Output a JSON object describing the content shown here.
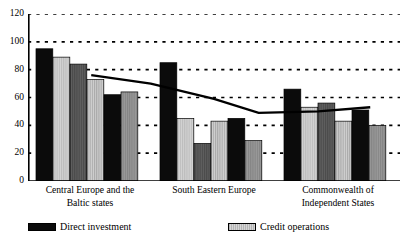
{
  "title": {
    "text": "",
    "cut_off": true
  },
  "legend": {
    "position": "bottom",
    "entries": [
      {
        "label": "Direct investment",
        "swatch": "solid-black"
      },
      {
        "label": "Credit operations",
        "swatch": "light-gray"
      }
    ]
  },
  "axis": {
    "y_ticks": [
      "0",
      "20",
      "40",
      "60",
      "80",
      "100",
      "120"
    ]
  },
  "categories": [
    {
      "line1": "Central Europe and the",
      "line2": "Baltic states"
    },
    {
      "line1": "South Eastern Europe",
      "line2": ""
    },
    {
      "line1": "Commonwealth of",
      "line2": "Independent States"
    }
  ],
  "chart_data": {
    "type": "bar",
    "title": "",
    "xlabel": "",
    "ylabel": "",
    "ylim": [
      0,
      120
    ],
    "yticks": [
      0,
      20,
      40,
      60,
      80,
      100,
      120
    ],
    "grid": true,
    "gridstyle": "dotted-horizontal",
    "legend_position": "bottom",
    "categories": [
      "Central Europe and the Baltic states",
      "South Eastern Europe",
      "Commonwealth of Independent States"
    ],
    "groups": [
      {
        "category": "Central Europe and the Baltic states",
        "bars": [
          {
            "value": 95,
            "fill": "solid-black"
          },
          {
            "value": 89,
            "fill": "light-gray"
          },
          {
            "value": 84,
            "fill": "dark-gray"
          },
          {
            "value": 73,
            "fill": "striped-light"
          },
          {
            "value": 62,
            "fill": "solid-black"
          },
          {
            "value": 64,
            "fill": "medium-gray"
          }
        ]
      },
      {
        "category": "South Eastern Europe",
        "bars": [
          {
            "value": 85,
            "fill": "solid-black"
          },
          {
            "value": 45,
            "fill": "light-gray"
          },
          {
            "value": 27,
            "fill": "dark-gray"
          },
          {
            "value": 43,
            "fill": "striped-light"
          },
          {
            "value": 45,
            "fill": "solid-black"
          },
          {
            "value": 29,
            "fill": "medium-gray"
          }
        ]
      },
      {
        "category": "Commonwealth of Independent States",
        "bars": [
          {
            "value": 66,
            "fill": "solid-black"
          },
          {
            "value": 53,
            "fill": "light-gray"
          },
          {
            "value": 56,
            "fill": "dark-gray"
          },
          {
            "value": 43,
            "fill": "striped-light"
          },
          {
            "value": 51,
            "fill": "solid-black"
          },
          {
            "value": 40,
            "fill": "medium-gray"
          }
        ]
      }
    ],
    "overlay_line": {
      "name": "trend",
      "color": "#000000",
      "points": [
        {
          "x": 0.17,
          "y": 76
        },
        {
          "x": 0.33,
          "y": 70
        },
        {
          "x": 0.5,
          "y": 59
        },
        {
          "x": 0.62,
          "y": 49
        },
        {
          "x": 0.78,
          "y": 50
        },
        {
          "x": 0.92,
          "y": 53
        }
      ]
    },
    "series": [
      {
        "name": "Direct investment",
        "values": [
          95,
          85,
          66
        ]
      },
      {
        "name": "Credit operations",
        "values": [
          89,
          45,
          53
        ]
      }
    ]
  },
  "colors": {
    "black": "#0b0b0b",
    "light_gray": "#c5c5c5",
    "medium_gray": "#8e8e8e",
    "dark_gray": "#5a5a5a",
    "axis": "#000000",
    "grid": "#000000",
    "background": "#ffffff"
  }
}
